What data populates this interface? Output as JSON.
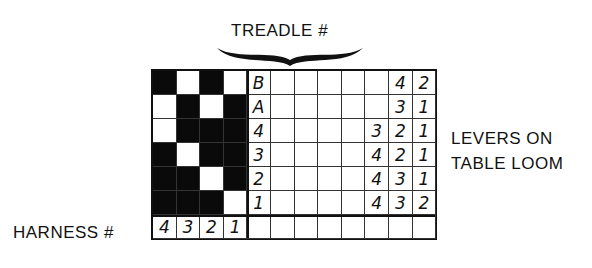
{
  "labels": {
    "treadle": "TREADLE #",
    "levers_line1": "LEVERS ON",
    "levers_line2": "TABLE LOOM",
    "harness": "HARNESS #"
  },
  "tieup": {
    "harness_numbers": [
      "4",
      "3",
      "2",
      "1"
    ],
    "rows": [
      {
        "treadle": "B",
        "cells": [
          1,
          0,
          1,
          0
        ],
        "levers": [
          "",
          "",
          "4",
          "2"
        ]
      },
      {
        "treadle": "A",
        "cells": [
          0,
          1,
          0,
          1
        ],
        "levers": [
          "",
          "",
          "3",
          "1"
        ]
      },
      {
        "treadle": "4",
        "cells": [
          0,
          1,
          1,
          1
        ],
        "levers": [
          "",
          "3",
          "2",
          "1"
        ]
      },
      {
        "treadle": "3",
        "cells": [
          1,
          0,
          1,
          1
        ],
        "levers": [
          "",
          "4",
          "2",
          "1"
        ]
      },
      {
        "treadle": "2",
        "cells": [
          1,
          1,
          0,
          1
        ],
        "levers": [
          "",
          "4",
          "3",
          "1"
        ]
      },
      {
        "treadle": "1",
        "cells": [
          1,
          1,
          1,
          0
        ],
        "levers": [
          "",
          "4",
          "3",
          "2"
        ]
      }
    ]
  },
  "colors": {
    "ink": "#111111",
    "paper": "#ffffff"
  }
}
